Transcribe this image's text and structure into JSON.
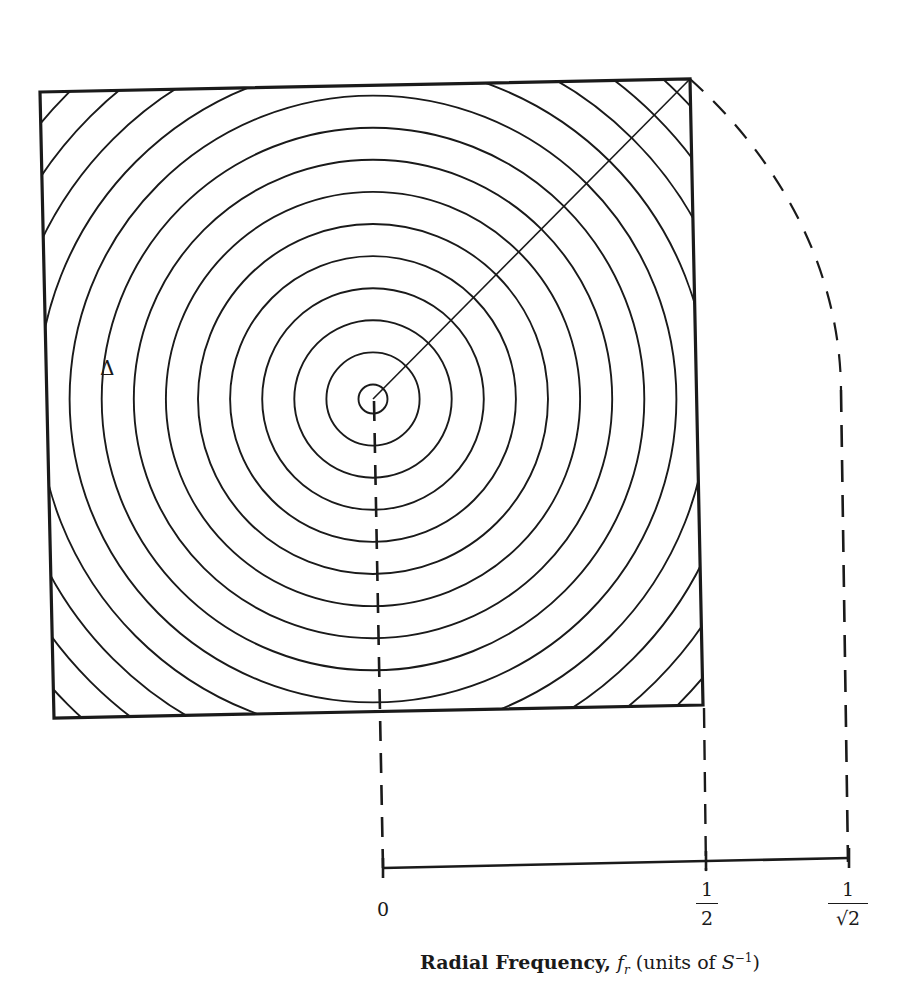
{
  "figure": {
    "center": {
      "x": 373,
      "y": 399
    },
    "square": {
      "corners": {
        "top_left": [
          40,
          92
        ],
        "top_right": [
          690,
          79
        ],
        "bottom_right": [
          703,
          705
        ],
        "bottom_left": [
          54,
          718
        ]
      },
      "stroke": "#1a1a1a"
    },
    "rings": {
      "first_radius": 14.5,
      "spacing": 32.1,
      "count": 14
    },
    "region_label": "Δ",
    "axis": {
      "start": [
        383,
        868
      ],
      "end": [
        849,
        858
      ],
      "ticks": [
        {
          "x": 383,
          "label_type": "plain",
          "label": "0"
        },
        {
          "x": 706,
          "label_type": "fraction",
          "numerator": "1",
          "denominator": "2"
        },
        {
          "x": 849,
          "label_type": "fraction",
          "numerator": "1",
          "denominator": "√2"
        }
      ]
    },
    "caption": {
      "bold_part": "Radial Frequency,",
      "var_base": "f",
      "var_sub": "r",
      "units_prefix": "(units of ",
      "units_var": "S",
      "units_sup": "−1",
      "units_suffix": ")"
    }
  }
}
